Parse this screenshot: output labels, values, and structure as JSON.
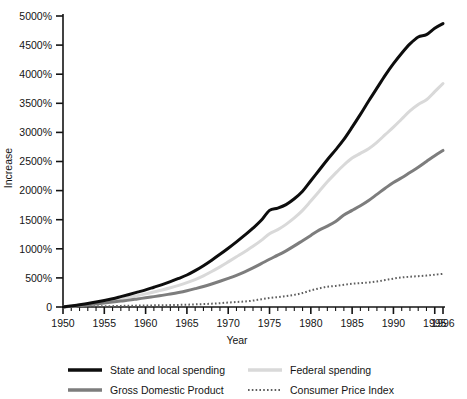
{
  "chart_data": {
    "type": "line",
    "title": "",
    "xlabel": "Year",
    "ylabel": "Increase",
    "xlim": [
      1950,
      1996
    ],
    "ylim": [
      0,
      5000
    ],
    "grid": false,
    "legend_position": "bottom",
    "y_tick_labels": [
      "0",
      "500%",
      "1000%",
      "1500%",
      "2000%",
      "2500%",
      "3000%",
      "3500%",
      "4000%",
      "4500%",
      "5000%"
    ],
    "y_ticks": [
      0,
      500,
      1000,
      1500,
      2000,
      2500,
      3000,
      3500,
      4000,
      4500,
      5000
    ],
    "x_tick_labels": [
      "1950",
      "1955",
      "1960",
      "1965",
      "1970",
      "1975",
      "1980",
      "1985",
      "1990",
      "1995",
      "1996"
    ],
    "x_ticks": [
      1950,
      1955,
      1960,
      1965,
      1970,
      1975,
      1980,
      1985,
      1990,
      1995,
      1996
    ],
    "x_minor_tick_interval": 1,
    "x": [
      1950,
      1951,
      1952,
      1953,
      1954,
      1955,
      1956,
      1957,
      1958,
      1959,
      1960,
      1961,
      1962,
      1963,
      1964,
      1965,
      1966,
      1967,
      1968,
      1969,
      1970,
      1971,
      1972,
      1973,
      1974,
      1975,
      1976,
      1977,
      1978,
      1979,
      1980,
      1981,
      1982,
      1983,
      1984,
      1985,
      1986,
      1987,
      1988,
      1989,
      1990,
      1991,
      1992,
      1993,
      1994,
      1995,
      1996
    ],
    "series": [
      {
        "name": "State and local spending",
        "color": "#0d0d0d",
        "style": "solid",
        "width": 3,
        "values": [
          0,
          18,
          38,
          60,
          85,
          112,
          142,
          178,
          215,
          255,
          295,
          340,
          385,
          435,
          490,
          550,
          625,
          710,
          805,
          905,
          1010,
          1120,
          1235,
          1355,
          1490,
          1660,
          1700,
          1760,
          1860,
          1990,
          2170,
          2350,
          2530,
          2700,
          2880,
          3090,
          3310,
          3540,
          3760,
          3980,
          4180,
          4360,
          4520,
          4640,
          4680,
          4790,
          4870
        ]
      },
      {
        "name": "Federal spending",
        "color": "#d9d9d9",
        "style": "solid",
        "width": 3,
        "values": [
          0,
          14,
          30,
          48,
          68,
          90,
          112,
          138,
          165,
          195,
          225,
          258,
          292,
          330,
          372,
          418,
          472,
          535,
          610,
          690,
          775,
          862,
          950,
          1042,
          1145,
          1260,
          1330,
          1420,
          1530,
          1660,
          1820,
          1985,
          2150,
          2300,
          2440,
          2560,
          2640,
          2720,
          2830,
          2960,
          3090,
          3230,
          3370,
          3480,
          3560,
          3700,
          3840
        ]
      },
      {
        "name": "Gross Domestic Product",
        "color": "#7d7d7d",
        "style": "solid",
        "width": 3,
        "values": [
          0,
          12,
          25,
          38,
          52,
          68,
          84,
          102,
          118,
          138,
          158,
          178,
          200,
          224,
          250,
          280,
          315,
          352,
          395,
          442,
          492,
          545,
          605,
          672,
          745,
          820,
          890,
          965,
          1050,
          1140,
          1230,
          1320,
          1390,
          1470,
          1580,
          1660,
          1740,
          1830,
          1935,
          2040,
          2140,
          2220,
          2310,
          2400,
          2500,
          2600,
          2690
        ]
      },
      {
        "name": "Consumer Price Index",
        "color": "#5e5e5e",
        "style": "dotted",
        "width": 2,
        "values": [
          0,
          6,
          10,
          12,
          13,
          13,
          15,
          19,
          22,
          24,
          27,
          28,
          31,
          33,
          36,
          39,
          45,
          50,
          57,
          66,
          76,
          86,
          95,
          110,
          133,
          154,
          170,
          187,
          208,
          240,
          285,
          320,
          348,
          362,
          382,
          400,
          410,
          422,
          440,
          462,
          488,
          508,
          520,
          530,
          540,
          555,
          570
        ]
      }
    ]
  },
  "legend": {
    "entries": [
      {
        "label": "State and local spending",
        "swatch": "solid-black"
      },
      {
        "label": "Federal spending",
        "swatch": "solid-light-gray"
      },
      {
        "label": "Gross Domestic Product",
        "swatch": "solid-mid-gray"
      },
      {
        "label": "Consumer Price Index",
        "swatch": "dotted-gray"
      }
    ]
  },
  "colors": {
    "state_local": "#0d0d0d",
    "federal": "#d9d9d9",
    "gdp": "#7d7d7d",
    "cpi": "#5e5e5e",
    "axis": "#141414",
    "background": "#ffffff"
  }
}
